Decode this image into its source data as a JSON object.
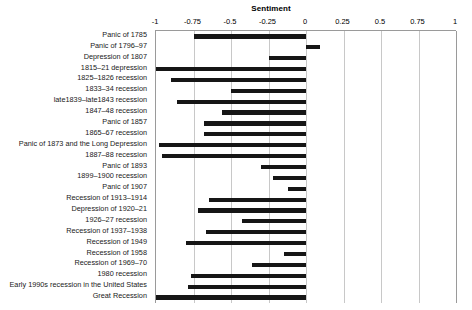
{
  "chart_data": {
    "type": "bar",
    "orientation": "horizontal",
    "title": "Sentiment",
    "xlabel": "",
    "ylabel": "",
    "xlim": [
      -1,
      1
    ],
    "xticks": [
      -1,
      -0.75,
      -0.5,
      -0.25,
      0,
      0.25,
      0.5,
      0.75,
      1
    ],
    "xticklabels": [
      "-1",
      "-0.75",
      "-0.5",
      "-0.25",
      "0",
      "0.25",
      "0.5",
      "0.75",
      "1"
    ],
    "grid": true,
    "legend": false,
    "axis_position": "top",
    "categories": [
      "Panic of 1785",
      "Panic of 1796–97",
      "Depression of 1807",
      "1815–21 depression",
      "1825–1826 recession",
      "1833–34 recession",
      "late1839–late1843 recession",
      "1847–48 recession",
      "Panic of 1857",
      "1865–67 recession",
      "Panic of 1873 and the Long Depression",
      "1887–88 recession",
      "Panic of 1893",
      "1899–1900 recession",
      "Panic of 1907",
      "Recession of 1913–1914",
      "Depression of 1920–21",
      "1926–27 recession",
      "Recession of 1937–1938",
      "Recession of 1949",
      "Recession of 1958",
      "Recession of 1969–70",
      "1980 recession",
      "Early 1990s recession in the United States",
      "Great Recession"
    ],
    "values": [
      -0.75,
      0.09,
      -0.25,
      -1.0,
      -0.9,
      -0.5,
      -0.86,
      -0.56,
      -0.68,
      -0.68,
      -0.98,
      -0.96,
      -0.3,
      -0.22,
      -0.12,
      -0.65,
      -0.72,
      -0.43,
      -0.67,
      -0.8,
      -0.15,
      -0.36,
      -0.77,
      -0.79,
      -1.0
    ],
    "bar_color": "#161616"
  },
  "axis": {
    "title": "Sentiment"
  }
}
